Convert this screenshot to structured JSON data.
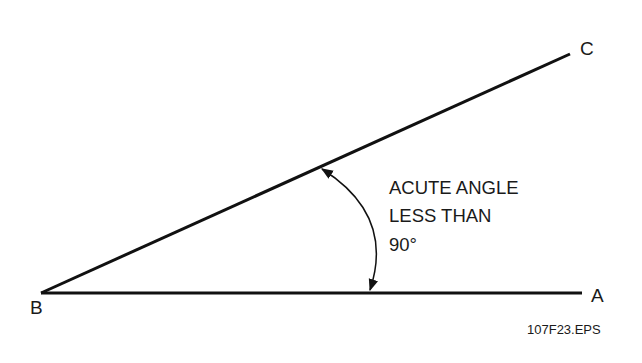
{
  "diagram": {
    "vertices": {
      "A": {
        "label": "A"
      },
      "B": {
        "label": "B"
      },
      "C": {
        "label": "C"
      }
    },
    "annotation": {
      "line1": "ACUTE ANGLE",
      "line2": "LESS THAN",
      "line3": "90°"
    },
    "figure_id": "107F23.EPS",
    "colors": {
      "stroke": "#111111",
      "background": "#ffffff"
    }
  }
}
